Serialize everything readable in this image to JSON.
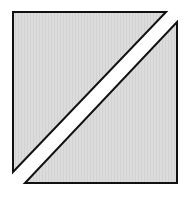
{
  "diagram": {
    "shapes": [
      {
        "name": "upper-left-triangle",
        "points": "13,12 166,12 13,172",
        "fill": "#d9d9d9",
        "stroke": "#111111"
      },
      {
        "name": "lower-right-triangle",
        "points": "177,22 177,183 25,183",
        "fill": "#d9d9d9",
        "stroke": "#111111"
      }
    ],
    "background": "#ffffff"
  }
}
